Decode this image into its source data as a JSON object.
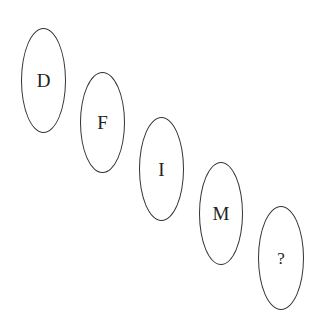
{
  "diagram": {
    "type": "letter-sequence-puzzle",
    "nodes": [
      {
        "label": "D"
      },
      {
        "label": "F"
      },
      {
        "label": "I"
      },
      {
        "label": "M"
      },
      {
        "label": "?"
      }
    ],
    "colors": {
      "stroke": "#333333",
      "text": "#222222",
      "background": "#ffffff"
    }
  }
}
